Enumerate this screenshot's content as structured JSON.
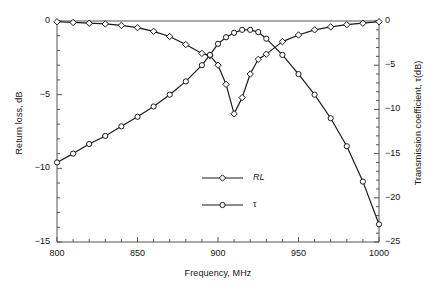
{
  "chart_data": {
    "type": "line",
    "title": "",
    "xlabel": "Frequency, MHz",
    "ylabel": "Return loss, dB",
    "ylabel_right": "Transmission coefficient, τ(dB)",
    "xlim": [
      800,
      1000
    ],
    "ylim": [
      -15,
      0
    ],
    "ylim_right": [
      -25,
      0
    ],
    "grid": false,
    "legend_position": "inside-lower-center-right",
    "xticks": [
      800,
      850,
      900,
      950,
      1000
    ],
    "xtick_labels": [
      "800",
      "850",
      "900",
      "950",
      "1000"
    ],
    "x_minor_tick_step": 10,
    "yticks_left": [
      0,
      -5,
      -10,
      -15
    ],
    "ytick_labels_left": [
      "0",
      "−5",
      "−10",
      "−15"
    ],
    "y_minor_tick_step_left": 1,
    "yticks_right": [
      0,
      -5,
      -10,
      -15,
      -20,
      -25
    ],
    "ytick_labels_right": [
      "0",
      "−5",
      "−10",
      "−15",
      "−20",
      "−25"
    ],
    "y_minor_tick_step_right": 1,
    "x": [
      800,
      810,
      820,
      830,
      840,
      850,
      860,
      870,
      880,
      890,
      895,
      900,
      905,
      910,
      915,
      920,
      925,
      930,
      940,
      950,
      960,
      970,
      980,
      990,
      1000
    ],
    "series": [
      {
        "name": "RL",
        "label": "RL",
        "marker": "diamond",
        "axis": "left",
        "color": "#1a1a1a",
        "values": [
          -0.05,
          -0.1,
          -0.15,
          -0.2,
          -0.3,
          -0.45,
          -0.7,
          -1.05,
          -1.6,
          -2.2,
          -2.35,
          -3.0,
          -4.3,
          -6.3,
          -5.2,
          -3.6,
          -2.6,
          -2.25,
          -1.4,
          -0.95,
          -0.6,
          -0.4,
          -0.25,
          -0.15,
          -0.05
        ]
      },
      {
        "name": "tau",
        "label": "τ",
        "marker": "circle",
        "axis": "left",
        "color": "#1a1a1a",
        "values": [
          -9.6,
          -9.0,
          -8.35,
          -7.8,
          -7.15,
          -6.5,
          -5.8,
          -5.0,
          -4.1,
          -3.0,
          -2.3,
          -1.55,
          -1.1,
          -0.8,
          -0.6,
          -0.6,
          -0.75,
          -1.2,
          -2.3,
          -3.6,
          -5.0,
          -6.6,
          -8.5,
          -10.9,
          -13.8
        ]
      }
    ]
  },
  "legend": {
    "entries": [
      {
        "label": "RL",
        "marker": "diamond",
        "italic": true
      },
      {
        "label": "τ",
        "marker": "circle",
        "italic": false
      }
    ]
  }
}
